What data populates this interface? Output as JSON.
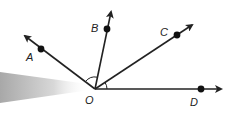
{
  "diagram": {
    "vertex": {
      "label": "O",
      "x": 95,
      "y": 89
    },
    "rays": [
      {
        "name": "A",
        "label": "A",
        "end": [
          25,
          36
        ],
        "point": [
          41,
          49
        ],
        "label_pos": [
          27,
          60
        ]
      },
      {
        "name": "B",
        "label": "B",
        "end": [
          111,
          12
        ],
        "point": [
          107,
          29
        ],
        "label_pos": [
          91,
          32
        ]
      },
      {
        "name": "C",
        "label": "C",
        "end": [
          192,
          25
        ],
        "point": [
          177,
          35
        ],
        "label_pos": [
          160,
          33
        ]
      },
      {
        "name": "D",
        "label": "D",
        "end": [
          221,
          89
        ],
        "point": [
          201,
          89
        ],
        "label_pos": [
          191,
          105
        ]
      }
    ],
    "angle_marks": [
      "angle-AOB",
      "angle-COD"
    ],
    "colors": {
      "line": "#222222",
      "shadow": "#bdbdbd"
    }
  }
}
